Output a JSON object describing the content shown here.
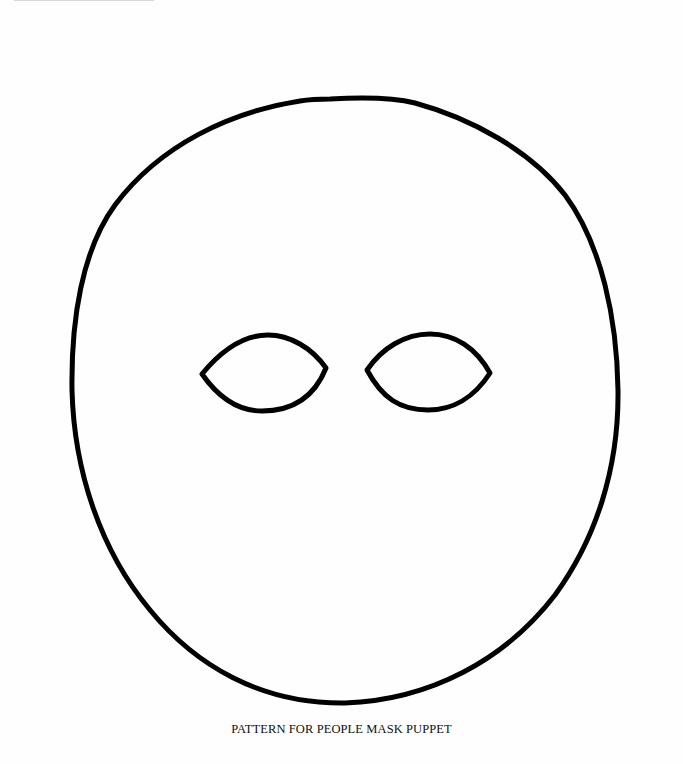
{
  "document": {
    "caption": "PATTERN FOR PEOPLE MASK PUPPET"
  },
  "figure": {
    "stroke_color": "#000000",
    "background_color": "#ffffff"
  }
}
